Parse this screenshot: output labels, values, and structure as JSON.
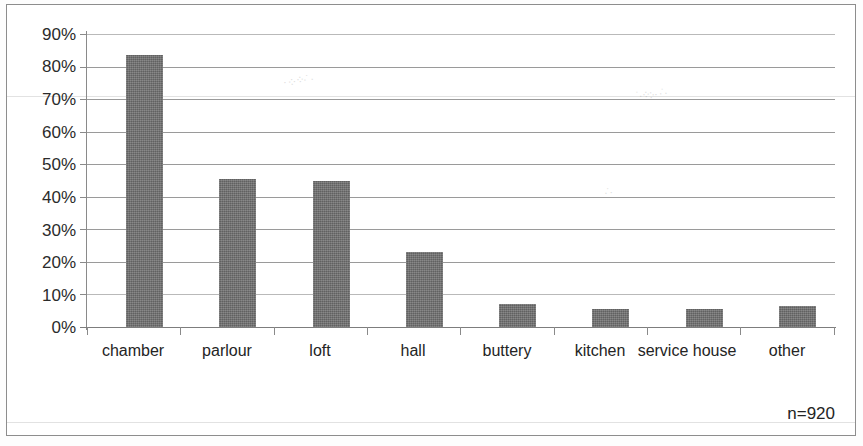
{
  "chart_data": {
    "type": "bar",
    "title": "",
    "xlabel": "",
    "ylabel": "",
    "categories": [
      "chamber",
      "parlour",
      "loft",
      "hall",
      "buttery",
      "kitchen",
      "service house",
      "other"
    ],
    "values": [
      83.5,
      45.5,
      45,
      23,
      7,
      5.5,
      5.5,
      6.5
    ],
    "value_suffix": "%",
    "ylim": [
      0,
      90
    ],
    "ytick_values": [
      0,
      10,
      20,
      30,
      40,
      50,
      60,
      70,
      80,
      90
    ],
    "ytick_labels": [
      "0%",
      "10%",
      "20%",
      "30%",
      "40%",
      "50%",
      "60%",
      "70%",
      "80%",
      "90%"
    ],
    "grid": true,
    "legend": false,
    "bar_color": "#6e6e6e",
    "gridline_color": "#9a9a9a",
    "annotations": [
      {
        "name": "sample-size",
        "text": "n=920"
      }
    ]
  },
  "figure": {
    "sample_size_note": "n=920",
    "border_color": "#8d8d8d"
  }
}
